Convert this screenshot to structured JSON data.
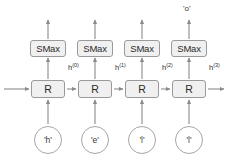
{
  "diagram": {
    "type": "rnn-unrolled",
    "colors": {
      "box_fill": "#f0f0f0",
      "box_stroke": "#9a9a9a",
      "circle_stroke": "#a6a6a6",
      "arrow": "#8a8a8a",
      "text": "#2b2b2b",
      "background": "#ffffff"
    },
    "timesteps": [
      {
        "index": 0,
        "input_label": "'h'",
        "recurrent_label": "R",
        "softmax_label": "SMax",
        "hidden_label_base": "h",
        "hidden_label_sup": "(0)",
        "output_label": ""
      },
      {
        "index": 1,
        "input_label": "'e'",
        "recurrent_label": "R",
        "softmax_label": "SMax",
        "hidden_label_base": "h",
        "hidden_label_sup": "(1)",
        "output_label": ""
      },
      {
        "index": 2,
        "input_label": "'l'",
        "recurrent_label": "R",
        "softmax_label": "SMax",
        "hidden_label_base": "h",
        "hidden_label_sup": "(2)",
        "output_label": ""
      },
      {
        "index": 3,
        "input_label": "'l'",
        "recurrent_label": "R",
        "softmax_label": "SMax",
        "hidden_label_base": "h",
        "hidden_label_sup": "(3)",
        "output_label": "'o'"
      }
    ],
    "final_output": "'o'"
  }
}
